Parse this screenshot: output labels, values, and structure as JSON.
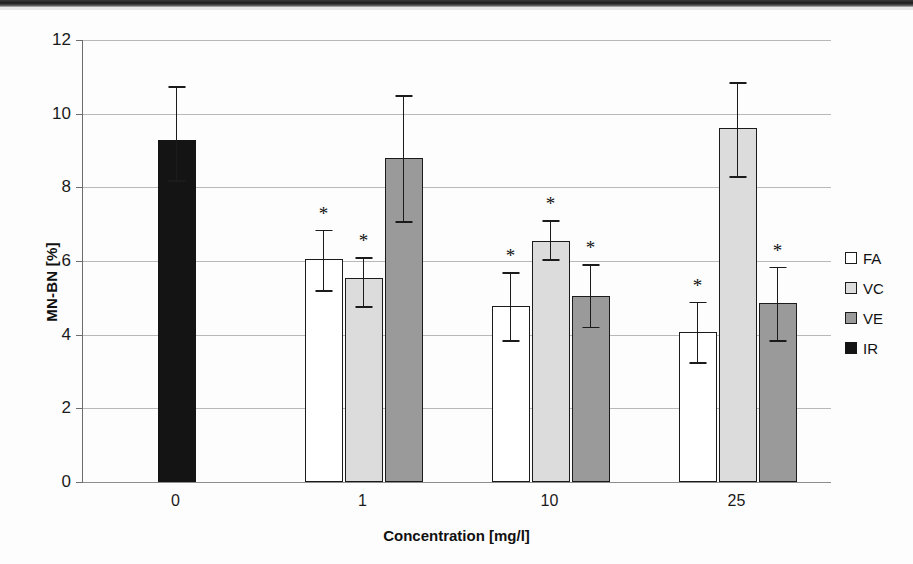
{
  "chart_data": {
    "type": "bar",
    "title": "",
    "xlabel": "Concentration [mg/l]",
    "ylabel": "MN-BN [%]",
    "categories": [
      "0",
      "1",
      "10",
      "25"
    ],
    "ylim": [
      0,
      12
    ],
    "yticks": [
      "0",
      "2",
      "4",
      "6",
      "8",
      "10",
      "12"
    ],
    "grid": true,
    "legend_position": "right",
    "significance_marker": "*",
    "series": [
      {
        "name": "FA",
        "color": "#ffffff",
        "values": [
          null,
          6.05,
          4.78,
          4.07
        ],
        "err_low": [
          null,
          5.2,
          3.85,
          3.25
        ],
        "err_high": [
          null,
          6.85,
          5.7,
          4.9
        ],
        "significant": [
          false,
          true,
          true,
          true
        ]
      },
      {
        "name": "VC",
        "color": "#dcdcdc",
        "values": [
          null,
          5.55,
          6.55,
          9.6
        ],
        "err_low": [
          null,
          4.78,
          6.05,
          8.3
        ],
        "err_high": [
          null,
          6.1,
          7.1,
          10.85
        ],
        "significant": [
          false,
          true,
          true,
          false
        ]
      },
      {
        "name": "VE",
        "color": "#9a9a9a",
        "values": [
          null,
          8.8,
          5.05,
          4.85
        ],
        "err_low": [
          null,
          7.08,
          4.22,
          3.85
        ],
        "err_high": [
          null,
          10.5,
          5.92,
          5.85
        ],
        "significant": [
          false,
          false,
          true,
          true
        ]
      },
      {
        "name": "IR",
        "color": "#141414",
        "values": [
          9.28,
          null,
          null,
          null
        ],
        "err_low": [
          8.2,
          null,
          null,
          null
        ],
        "err_high": [
          10.75,
          null,
          null,
          null
        ],
        "significant": [
          false,
          false,
          false,
          false
        ]
      }
    ]
  },
  "legend": {
    "items": [
      {
        "label": "FA"
      },
      {
        "label": "VC"
      },
      {
        "label": "VE"
      },
      {
        "label": "IR"
      }
    ]
  }
}
